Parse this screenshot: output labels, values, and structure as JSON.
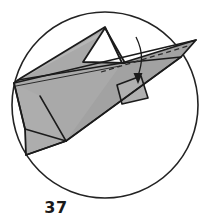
{
  "figure": {
    "caption": "37",
    "kind": "origami-fold-diagram-in-circle",
    "colors": {
      "background": "#ffffff",
      "paper_fill": "#a9a9a9",
      "paper_fill_light": "#b4b4b4",
      "paper_fill_dark": "#9d9d9d",
      "stroke": "#1b1b1b",
      "circle_stroke": "#232323",
      "hidden_edge_stroke": "#2a2a2a",
      "caption_color": "#1a1a1a"
    },
    "circle": {
      "cx": 105,
      "cy": 105,
      "r": 93,
      "stroke_width": 1.6,
      "fill": "none"
    },
    "shapes": {
      "main_sheet": "M 14,83 L 21,78 L 105,27 L 122,63 L 196,40 L 181,57 L 66,141 L 26,155 L 25,129 Z",
      "white_notch": "M 105,28 L 84,62 L 124,63 Z",
      "big_wing": "M 196,40 L 122,63 L 66,141 L 181,57 Z",
      "left_panel": "M 14,83 L 25,129 L 26,155 L 66,141 L 40,96 Z",
      "small_quad": "M 117,85 L 141,76 L 148,98 L 122,104 Z"
    },
    "fold_lines": [
      "M 21,78 L 105,27",
      "M 14,83 L 196,40",
      "M 40,96 L 66,141",
      "M 25,129 L 66,141",
      "M 26,155 L 66,141",
      "M 66,141 L 181,57",
      "M 122,63 L 181,57",
      "M 84,62 L 124,63",
      "M 105,28 L 84,62",
      "M 105,28 L 124,63",
      "M 117,85 L 141,76",
      "M 117,85 L 122,104",
      "M 141,76 L 148,98",
      "M 14,83 L 25,129",
      "M 17,80 L 196,40"
    ],
    "hidden_edges": [
      "M 100,72 L 186,46"
    ],
    "arrow": {
      "path": "M 136,38 C 144,54 142,64 138,78",
      "head": "M 138,84 L 134,74 L 142,74 Z",
      "label": ""
    }
  }
}
